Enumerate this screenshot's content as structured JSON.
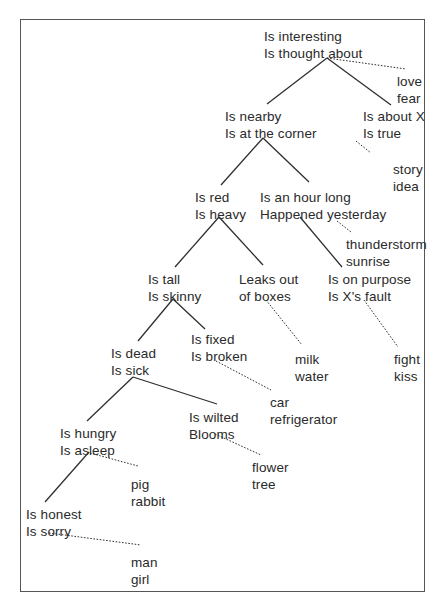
{
  "diagram": {
    "type": "decision-tree",
    "nodes": [
      {
        "id": "root",
        "lines": [
          "Is interesting",
          "Is thought about"
        ],
        "x": 264,
        "y": 29,
        "kind": "question"
      },
      {
        "id": "love-fear",
        "lines": [
          "love",
          "fear"
        ],
        "x": 397,
        "y": 74,
        "kind": "leaf"
      },
      {
        "id": "nearby",
        "lines": [
          "Is nearby",
          "Is at the corner"
        ],
        "x": 225,
        "y": 109,
        "kind": "question"
      },
      {
        "id": "about-x",
        "lines": [
          "Is about X",
          "Is true"
        ],
        "x": 363,
        "y": 109,
        "kind": "question"
      },
      {
        "id": "story-idea",
        "lines": [
          "story",
          "idea"
        ],
        "x": 393,
        "y": 162,
        "kind": "leaf"
      },
      {
        "id": "red",
        "lines": [
          "Is red",
          "Is heavy"
        ],
        "x": 195,
        "y": 190,
        "kind": "question"
      },
      {
        "id": "hour",
        "lines": [
          "Is an hour long",
          "Happened yesterday"
        ],
        "x": 260,
        "y": 190,
        "kind": "question"
      },
      {
        "id": "thunderstorm-sunrise",
        "lines": [
          "thunderstorm",
          "sunrise"
        ],
        "x": 346,
        "y": 237,
        "kind": "leaf"
      },
      {
        "id": "tall",
        "lines": [
          "Is tall",
          "Is skinny"
        ],
        "x": 148,
        "y": 272,
        "kind": "question"
      },
      {
        "id": "leaks",
        "lines": [
          "Leaks out",
          "of boxes"
        ],
        "x": 239,
        "y": 272,
        "kind": "question"
      },
      {
        "id": "purpose",
        "lines": [
          "Is on purpose",
          "Is X's fault"
        ],
        "x": 328,
        "y": 272,
        "kind": "question"
      },
      {
        "id": "fixed",
        "lines": [
          "Is fixed",
          "Is broken"
        ],
        "x": 191,
        "y": 332,
        "kind": "question"
      },
      {
        "id": "dead",
        "lines": [
          "Is dead",
          "Is sick"
        ],
        "x": 111,
        "y": 346,
        "kind": "question"
      },
      {
        "id": "milk-water",
        "lines": [
          "milk",
          "water"
        ],
        "x": 295,
        "y": 352,
        "kind": "leaf"
      },
      {
        "id": "fight-kiss",
        "lines": [
          "fight",
          "kiss"
        ],
        "x": 394,
        "y": 352,
        "kind": "leaf"
      },
      {
        "id": "car-refrigerator",
        "lines": [
          "car",
          "refrigerator"
        ],
        "x": 270,
        "y": 395,
        "kind": "leaf"
      },
      {
        "id": "wilted",
        "lines": [
          "Is wilted",
          "Blooms"
        ],
        "x": 189,
        "y": 410,
        "kind": "question"
      },
      {
        "id": "hungry",
        "lines": [
          "Is hungry",
          "Is asleep"
        ],
        "x": 60,
        "y": 426,
        "kind": "question"
      },
      {
        "id": "flower-tree",
        "lines": [
          "flower",
          "tree"
        ],
        "x": 252,
        "y": 460,
        "kind": "leaf"
      },
      {
        "id": "pig-rabbit",
        "lines": [
          "pig",
          "rabbit"
        ],
        "x": 131,
        "y": 477,
        "kind": "leaf"
      },
      {
        "id": "honest",
        "lines": [
          "Is honest",
          "Is sorry"
        ],
        "x": 26,
        "y": 507,
        "kind": "question"
      },
      {
        "id": "man-girl",
        "lines": [
          "man",
          "girl"
        ],
        "x": 131,
        "y": 555,
        "kind": "leaf"
      }
    ],
    "edges": [
      {
        "from": "root",
        "to": "nearby",
        "style": "solid",
        "x1": 327,
        "y1": 58,
        "x2": 267,
        "y2": 104
      },
      {
        "from": "root",
        "to": "about-x",
        "style": "solid",
        "x1": 327,
        "y1": 58,
        "x2": 391,
        "y2": 105
      },
      {
        "from": "root",
        "to": "love-fear",
        "style": "dotted",
        "x1": 327,
        "y1": 58,
        "x2": 406,
        "y2": 69
      },
      {
        "from": "nearby",
        "to": "red",
        "style": "solid",
        "x1": 263,
        "y1": 138,
        "x2": 221,
        "y2": 185
      },
      {
        "from": "nearby",
        "to": "hour",
        "style": "solid",
        "x1": 263,
        "y1": 138,
        "x2": 309,
        "y2": 182
      },
      {
        "from": "about-x",
        "to": "story-idea",
        "style": "dotted",
        "x1": 356,
        "y1": 141,
        "x2": 371,
        "y2": 153
      },
      {
        "from": "red",
        "to": "tall",
        "style": "solid",
        "x1": 219,
        "y1": 217,
        "x2": 175,
        "y2": 267
      },
      {
        "from": "red",
        "to": "leaks",
        "style": "solid",
        "x1": 219,
        "y1": 217,
        "x2": 263,
        "y2": 265
      },
      {
        "from": "hour",
        "to": "purpose",
        "style": "solid",
        "x1": 300,
        "y1": 217,
        "x2": 342,
        "y2": 267
      },
      {
        "from": "hour",
        "to": "thunderstorm-sunrise",
        "style": "dotted",
        "x1": 337,
        "y1": 221,
        "x2": 351,
        "y2": 232
      },
      {
        "from": "tall",
        "to": "dead",
        "style": "solid",
        "x1": 173,
        "y1": 299,
        "x2": 138,
        "y2": 341
      },
      {
        "from": "tall",
        "to": "fixed",
        "style": "solid",
        "x1": 173,
        "y1": 299,
        "x2": 205,
        "y2": 329
      },
      {
        "from": "leaks",
        "to": "milk-water",
        "style": "dotted",
        "x1": 266,
        "y1": 300,
        "x2": 302,
        "y2": 345
      },
      {
        "from": "purpose",
        "to": "fight-kiss",
        "style": "dotted",
        "x1": 364,
        "y1": 300,
        "x2": 398,
        "y2": 347
      },
      {
        "from": "fixed",
        "to": "car-refrigerator",
        "style": "dotted",
        "x1": 216,
        "y1": 361,
        "x2": 271,
        "y2": 390
      },
      {
        "from": "dead",
        "to": "hungry",
        "style": "solid",
        "x1": 133,
        "y1": 377,
        "x2": 87,
        "y2": 421
      },
      {
        "from": "dead",
        "to": "wilted",
        "style": "solid",
        "x1": 133,
        "y1": 377,
        "x2": 217,
        "y2": 404
      },
      {
        "from": "wilted",
        "to": "flower-tree",
        "style": "dotted",
        "x1": 215,
        "y1": 434,
        "x2": 261,
        "y2": 455
      },
      {
        "from": "hungry",
        "to": "honest",
        "style": "solid",
        "x1": 89,
        "y1": 452,
        "x2": 45,
        "y2": 502
      },
      {
        "from": "hungry",
        "to": "pig-rabbit",
        "style": "dotted",
        "x1": 90,
        "y1": 453,
        "x2": 138,
        "y2": 466
      },
      {
        "from": "honest",
        "to": "man-girl",
        "style": "dotted",
        "x1": 49,
        "y1": 533,
        "x2": 141,
        "y2": 545
      }
    ]
  },
  "colors": {
    "text": "#2a2a2a",
    "line": "#2f2f2f",
    "border": "#555555",
    "background": "#ffffff"
  }
}
